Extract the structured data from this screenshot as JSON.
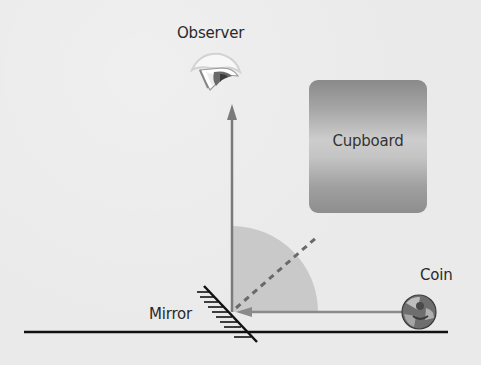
{
  "diagram": {
    "type": "plane-mirror-reflection",
    "labels": {
      "observer": "Observer",
      "cupboard": "Cupboard",
      "mirror": "Mirror",
      "coin": "Coin"
    },
    "icons": {
      "observer": "eye-icon",
      "coin": "coin-icon",
      "mirror": "hatched-mirror-icon"
    },
    "rays": {
      "incident": "coin-to-mirror (horizontal, arrow pointing left)",
      "reflected": "mirror-to-observer (vertical, arrow pointing up)",
      "normal": "dashed line at 45° from mirror"
    },
    "colors": {
      "background": "#eaeaea",
      "ray": "#7a7a7a",
      "angle_wedge": "#c9c9c9",
      "normal_dashed": "#6a6a6a",
      "ground_line": "#111111",
      "text": "#2a2a2a"
    }
  }
}
